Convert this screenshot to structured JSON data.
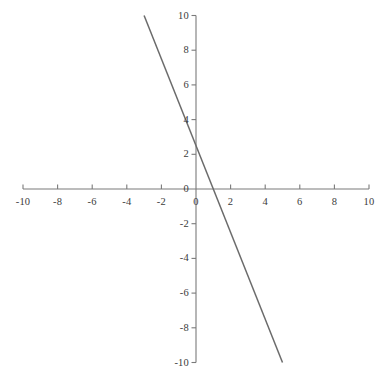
{
  "figure": {
    "width": 385,
    "height": 372,
    "background_color": "#ffffff",
    "axis_color": "#7a7a7a",
    "line_color": "#6b6b6b",
    "label_color": "#3b3b3b"
  },
  "chart_data": {
    "type": "line",
    "title": "",
    "xlabel": "",
    "ylabel": "",
    "xlim": [
      -10,
      10
    ],
    "ylim": [
      -10,
      10
    ],
    "grid": false,
    "legend": "none",
    "axes_style": "cartesian-cross",
    "x_ticks": [
      -10,
      -8,
      -6,
      -4,
      -2,
      0,
      2,
      4,
      6,
      8,
      10
    ],
    "y_ticks": [
      -10,
      -8,
      -6,
      -4,
      -2,
      0,
      2,
      4,
      6,
      8,
      10
    ],
    "x_tick_labels": [
      "-10",
      "-8",
      "-6",
      "-4",
      "-2",
      "0",
      "2",
      "4",
      "6",
      "8",
      "10"
    ],
    "y_tick_labels": [
      "-10",
      "-8",
      "-6",
      "-4",
      "-2",
      "0",
      "2",
      "4",
      "6",
      "8",
      "10"
    ],
    "origin_x_label": "0",
    "series": [
      {
        "name": "line",
        "equation": "y = -2.5x + 2.5",
        "slope": -2.5,
        "intercept": 2.5,
        "x_intercept": 1,
        "color": "#6b6b6b",
        "x": [
          -3,
          5
        ],
        "values": [
          10,
          -10
        ],
        "points": [
          [
            -3,
            10
          ],
          [
            5,
            -10
          ]
        ]
      }
    ]
  }
}
